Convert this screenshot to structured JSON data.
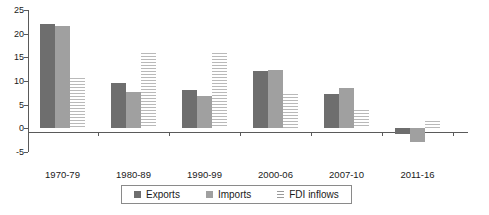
{
  "chart_data": {
    "type": "bar",
    "title": "",
    "subtitle": "",
    "xlabel": "",
    "ylabel": "",
    "ylim": [
      -5,
      25
    ],
    "ytick_labels": [
      "25",
      "20",
      "15",
      "10",
      "5",
      "0",
      "-5"
    ],
    "ytick_values": [
      25,
      20,
      15,
      10,
      5,
      0,
      -5
    ],
    "grid": false,
    "legend_position": "bottom",
    "categories": [
      "1970-79",
      "1980-89",
      "1990-99",
      "2000-06",
      "2007-10",
      "2011-16"
    ],
    "series": [
      {
        "name": "Exports",
        "color": "#6e6e6e",
        "pattern": "solid",
        "values": [
          22.1,
          9.5,
          8.0,
          12.2,
          7.2,
          -1.3
        ]
      },
      {
        "name": "Imports",
        "color": "#a0a0a0",
        "pattern": "solid",
        "values": [
          21.6,
          7.7,
          6.9,
          12.4,
          8.6,
          -2.8
        ]
      },
      {
        "name": "FDI inflows",
        "color": "#b9b9b9",
        "pattern": "horizontal-stripes",
        "values": [
          10.7,
          16.0,
          16.0,
          7.2,
          3.8,
          1.5
        ]
      }
    ]
  },
  "legend": {
    "items": [
      {
        "label": "Exports",
        "swatch": "exports-swatch"
      },
      {
        "label": "Imports",
        "swatch": "imports-swatch"
      },
      {
        "label": "FDI inflows",
        "swatch": "fdi-inflows-swatch"
      }
    ]
  },
  "axis": {
    "y_labels": [
      "25",
      "20",
      "15",
      "10",
      "5",
      "0",
      "-5"
    ],
    "x_labels": [
      "1970-79",
      "1980-89",
      "1990-99",
      "2000-06",
      "2007-10",
      "2011-16"
    ]
  }
}
